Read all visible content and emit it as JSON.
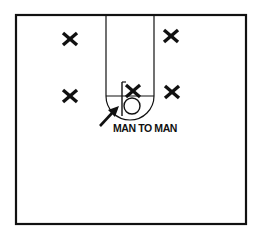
{
  "diagram": {
    "title": "",
    "label": "MAN TO MAN",
    "colors": {
      "ink": "#111111",
      "background": "#ffffff"
    },
    "court": {
      "outline": {
        "x1": 16,
        "y1": 15,
        "x2": 246,
        "y2": 224
      },
      "lane": {
        "left_x": 106,
        "right_x": 154,
        "top_y": 15,
        "free_throw_y": 96
      },
      "free_throw_circle_bottom_y": 120,
      "backboard": {
        "x": 122,
        "y1": 82,
        "y2": 116
      },
      "basket": {
        "cx": 132,
        "cy": 106,
        "r": 8
      }
    },
    "players": [
      {
        "symbol": "X",
        "role": "offense",
        "position": "top-left",
        "x": 70,
        "y": 39
      },
      {
        "symbol": "X",
        "role": "offense",
        "position": "top-right",
        "x": 171,
        "y": 36
      },
      {
        "symbol": "X",
        "role": "offense",
        "position": "wing-left",
        "x": 70,
        "y": 96
      },
      {
        "symbol": "X",
        "role": "offense",
        "position": "post-center",
        "x": 133,
        "y": 91
      },
      {
        "symbol": "X",
        "role": "offense",
        "position": "wing-right",
        "x": 172,
        "y": 92
      }
    ],
    "arrow": {
      "from": {
        "x": 100,
        "y": 126
      },
      "to": {
        "x": 118,
        "y": 107
      },
      "meaning": "points to defender position"
    }
  }
}
